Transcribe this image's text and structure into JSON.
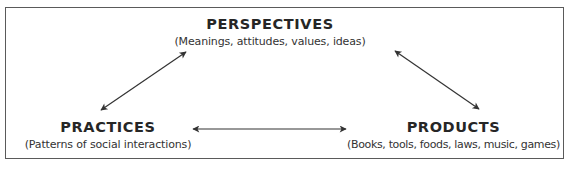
{
  "diagram": {
    "type": "triangle-relationship",
    "nodes": [
      {
        "id": "perspectives",
        "title": "PERSPECTIVES",
        "subtitle": "(Meanings, attitudes, values, ideas)"
      },
      {
        "id": "practices",
        "title": "PRACTICES",
        "subtitle": "(Patterns of social interactions)"
      },
      {
        "id": "products",
        "title": "PRODUCTS",
        "subtitle": "(Books, tools, foods, laws, music, games)"
      }
    ],
    "edges": [
      {
        "from": "practices",
        "to": "perspectives",
        "style": "double-headed-arrow"
      },
      {
        "from": "perspectives",
        "to": "products",
        "style": "double-headed-arrow"
      },
      {
        "from": "practices",
        "to": "products",
        "style": "double-headed-arrow"
      }
    ],
    "colors": {
      "text": "#262626",
      "arrow": "#333333",
      "border": "#5a5a5a",
      "background": "#ffffff"
    }
  }
}
